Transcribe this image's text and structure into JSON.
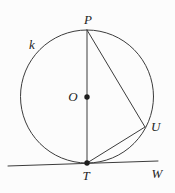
{
  "figure": {
    "type": "geometry-diagram",
    "labels": {
      "circle": "k",
      "center": "O",
      "top_point": "P",
      "bottom_point": "T",
      "right_point": "U",
      "tangent_line": "W"
    },
    "colors": {
      "background": "#fcfcfc",
      "line": "#3c3c3c",
      "dot": "#1f1f1f",
      "text": "#242424"
    },
    "geometry": {
      "circle_center_px": [
        87,
        96.5
      ],
      "circle_radius_px": 66.5,
      "P_px": [
        87,
        30
      ],
      "T_px": [
        87,
        163
      ],
      "O_px": [
        87,
        97
      ],
      "U_px": [
        145,
        127
      ],
      "tangent_endpoints_px": [
        [
          8,
          166
        ],
        [
          158,
          161
        ]
      ]
    }
  }
}
